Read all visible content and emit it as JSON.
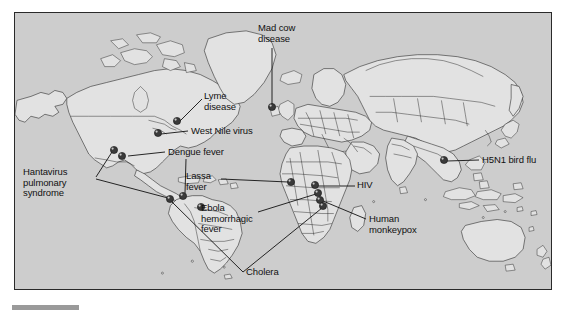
{
  "figure": {
    "type": "map",
    "title": "",
    "map_background_color": "#cdcdcd",
    "land_color": "#e2e2e2",
    "outline_color": "#1d1d1d",
    "marker_color": "#3a3a3a",
    "label_color": "#111111"
  },
  "labels": [
    {
      "id": "mad-cow-disease",
      "text": "Mad cow\ndisease",
      "lines": [
        "Mad cow",
        "disease"
      ],
      "x": 258,
      "y": 24,
      "align": "left",
      "marker": {
        "x": 272,
        "y": 107
      }
    },
    {
      "id": "lyme-disease",
      "text": "Lyme\ndisease",
      "lines": [
        "Lyme",
        "disease"
      ],
      "x": 204,
      "y": 92,
      "align": "left",
      "marker": {
        "x": 177,
        "y": 121
      }
    },
    {
      "id": "west-nile-virus",
      "text": "West Nile virus",
      "lines": [
        "West Nile virus"
      ],
      "x": 190,
      "y": 127,
      "align": "left",
      "marker": {
        "x": 158,
        "y": 133
      }
    },
    {
      "id": "dengue-fever",
      "text": "Dengue fever",
      "lines": [
        "Dengue fever"
      ],
      "x": 167,
      "y": 149,
      "align": "left",
      "marker": {
        "x": 183,
        "y": 196
      }
    },
    {
      "id": "hantavirus-pulmonary-syndrome",
      "text": "Hantavirus\npulmonary\nsyndrome",
      "lines": [
        "Hantavirus",
        "pulmonary",
        "syndrome"
      ],
      "x": 22,
      "y": 168,
      "align": "left",
      "marker": {
        "x": 114,
        "y": 150
      }
    },
    {
      "id": "lassa-fever",
      "text": "Lassa\nfever",
      "lines": [
        "Lassa",
        "fever"
      ],
      "x": 185,
      "y": 172,
      "align": "left",
      "marker": {
        "x": 291,
        "y": 182
      }
    },
    {
      "id": "ebola-hemorrhagic-fever",
      "text": "Ebola\nhemorrhagic\nfever",
      "lines": [
        "Ebola",
        "hemorrhagic",
        "fever"
      ],
      "x": 200,
      "y": 205,
      "align": "left",
      "marker": {
        "x": 318,
        "y": 192
      }
    },
    {
      "id": "cholera",
      "text": "Cholera",
      "lines": [
        "Cholera"
      ],
      "x": 245,
      "y": 272,
      "align": "left",
      "markers": [
        {
          "x": 170,
          "y": 199
        },
        {
          "x": 323,
          "y": 205
        }
      ]
    },
    {
      "id": "hiv",
      "text": "HIV",
      "lines": [
        "HIV"
      ],
      "x": 357,
      "y": 184,
      "align": "left",
      "marker": {
        "x": 315,
        "y": 185
      }
    },
    {
      "id": "human-monkeypox",
      "text": "Human\nmonkeypox",
      "lines": [
        "Human",
        "monkeypox"
      ],
      "x": 368,
      "y": 216,
      "align": "left",
      "marker": {
        "x": 320,
        "y": 199
      }
    },
    {
      "id": "h5n1-bird-flu",
      "text": "H5N1 bird flu",
      "lines": [
        "H5N1 bird flu"
      ],
      "x": 482,
      "y": 155,
      "align": "left",
      "marker": {
        "x": 444,
        "y": 160
      }
    }
  ],
  "markers": [
    {
      "id": "marker-mad-cow",
      "disease": "Mad cow disease",
      "x": 272,
      "y": 107
    },
    {
      "id": "marker-lyme",
      "disease": "Lyme disease",
      "x": 177,
      "y": 121
    },
    {
      "id": "marker-west-nile",
      "disease": "West Nile virus",
      "x": 158,
      "y": 133
    },
    {
      "id": "marker-hantavirus-a",
      "disease": "Hantavirus pulmonary syndrome",
      "x": 114,
      "y": 150
    },
    {
      "id": "marker-hantavirus-b",
      "disease": "Hantavirus pulmonary syndrome",
      "x": 121,
      "y": 155
    },
    {
      "id": "marker-dengue",
      "disease": "Dengue fever",
      "x": 183,
      "y": 196
    },
    {
      "id": "marker-cholera-sa",
      "disease": "Cholera",
      "x": 170,
      "y": 199
    },
    {
      "id": "marker-dengue-br",
      "disease": "Dengue fever",
      "x": 201,
      "y": 207
    },
    {
      "id": "marker-lassa",
      "disease": "Lassa fever",
      "x": 291,
      "y": 182
    },
    {
      "id": "marker-ebola",
      "disease": "Ebola hemorrhagic fever",
      "x": 318,
      "y": 192
    },
    {
      "id": "marker-hiv",
      "disease": "HIV",
      "x": 315,
      "y": 185
    },
    {
      "id": "marker-monkeypox",
      "disease": "Human monkeypox",
      "x": 320,
      "y": 199
    },
    {
      "id": "marker-cholera-af",
      "disease": "Cholera",
      "x": 323,
      "y": 205
    },
    {
      "id": "marker-h5n1",
      "disease": "H5N1 bird flu",
      "x": 444,
      "y": 160
    }
  ]
}
